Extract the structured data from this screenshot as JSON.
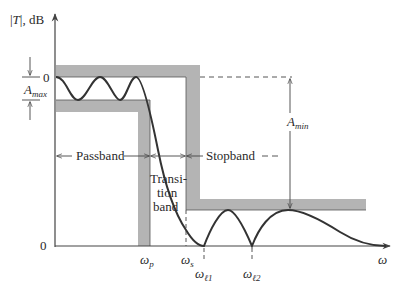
{
  "figure": {
    "y_axis_label_T": "T",
    "y_axis_label_unit": ", dB",
    "y_tick_top": "0",
    "y_tick_bottom": "0",
    "x_axis_label": "ω",
    "a_max_main": "A",
    "a_max_sub": "max",
    "a_min_main": "A",
    "a_min_sub": "min",
    "passband_label": "Passband",
    "stopband_label": "Stopband",
    "transition_line1": "Transi-",
    "transition_line2": "tion",
    "transition_line3": "band",
    "omega_p_main": "ω",
    "omega_p_sub": "p",
    "omega_s_main": "ω",
    "omega_s_sub": "s",
    "omega_l1_main": "ω",
    "omega_l1_sub": "ℓ1",
    "omega_l2_main": "ω",
    "omega_l2_sub": "ℓ2"
  },
  "colors": {
    "band": "#b4b4b4",
    "curve": "#333333",
    "axis": "#444444"
  }
}
